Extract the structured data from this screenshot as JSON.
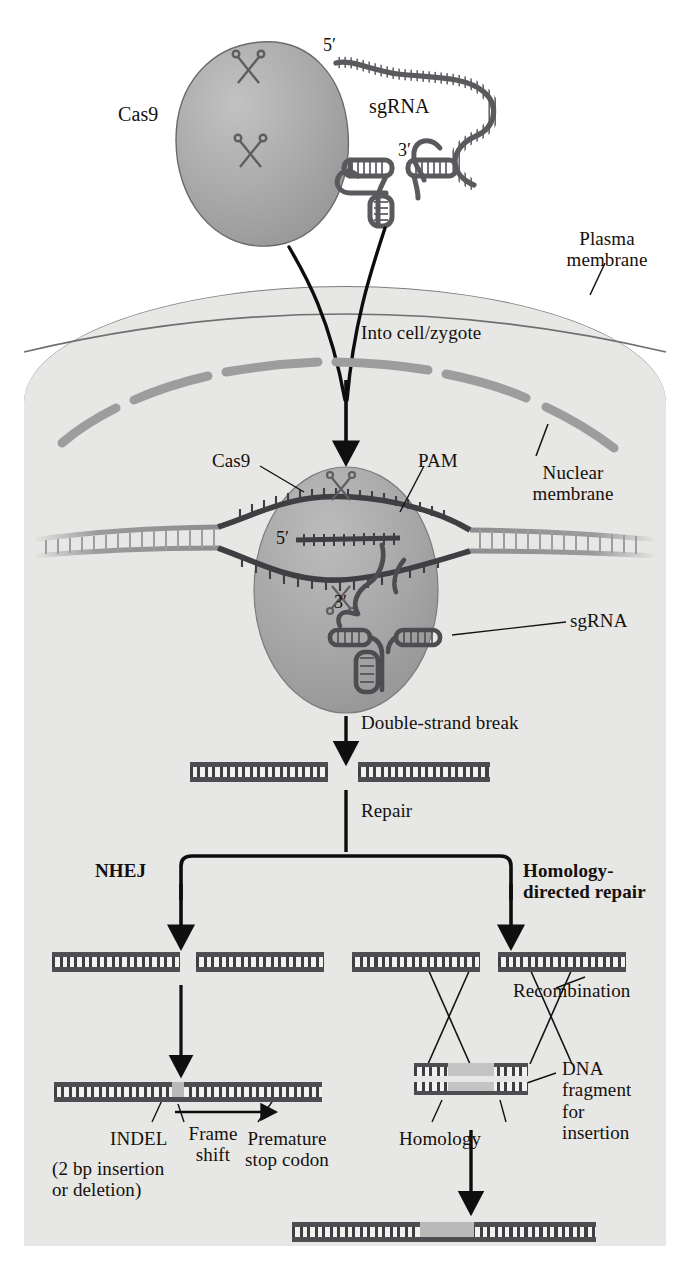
{
  "figure": {
    "background_color": "#ffffff",
    "cell_fill": "#e7e7e5",
    "protein_fill": "#a9a9a9",
    "dna_dark": "#4e4e52",
    "dna_light": "#8e8e90",
    "insert_patch": "#b9b9b9"
  },
  "labels": {
    "cas9_top": "Cas9",
    "sgrna_top": "sgRNA",
    "five_prime_top": "5′",
    "three_prime_top": "3′",
    "plasma_membrane": "Plasma\nmembrane",
    "into_cell": "Into cell/zygote",
    "cas9_nucleus": "Cas9",
    "pam": "PAM",
    "nuclear_membrane": "Nuclear\nmembrane",
    "five_prime_nucleus": "5′",
    "three_prime_nucleus": "3′",
    "sgrna_nucleus": "sgRNA",
    "double_strand_break": "Double-strand break",
    "repair": "Repair",
    "nhej": "NHEJ",
    "hdr": "Homology-\ndirected repair",
    "recombination": "Recombination",
    "indel": "INDEL",
    "indel_detail": "(2 bp insertion\nor deletion)",
    "frame_shift": "Frame\nshift",
    "premature_stop": "Premature\nstop codon",
    "homology": "Homology",
    "dna_fragment": "DNA\nfragment\nfor\ninsertion"
  },
  "icons": {
    "scissors_upper": "scissors-icon",
    "scissors_lower": "scissors-icon",
    "scissors_nucleus_upper": "scissors-icon",
    "scissors_nucleus_lower": "scissors-icon"
  },
  "diagram_steps": [
    {
      "id": "components",
      "text": "Cas9 protein and sgRNA delivered"
    },
    {
      "id": "delivery",
      "text": "Into cell/zygote"
    },
    {
      "id": "targeting",
      "text": "Cas9 + sgRNA bind DNA at PAM"
    },
    {
      "id": "cut",
      "text": "Double-strand break"
    },
    {
      "id": "repair",
      "text": "Repair"
    },
    {
      "id": "nhej",
      "text": "NHEJ"
    },
    {
      "id": "hdr",
      "text": "Homology-directed repair"
    },
    {
      "id": "nhej_outcome",
      "text": "INDEL (2 bp insertion or deletion) → Frame shift → Premature stop codon"
    },
    {
      "id": "hdr_outcome",
      "text": "Recombination with DNA fragment for insertion via homology arms"
    }
  ]
}
